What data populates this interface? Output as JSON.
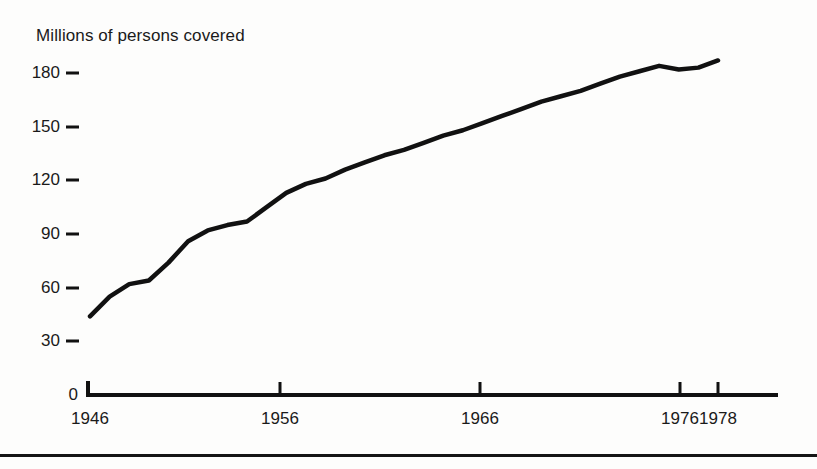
{
  "figure": {
    "width": 817,
    "height": 469,
    "background_color": "#fdfdfc",
    "ink_color": "#111111",
    "bottom_rule": "horizontal-rule"
  },
  "axis_geometry": {
    "x_left_px": 88,
    "x_right_px": 778,
    "y_zero_px": 395,
    "y_180_px": 73,
    "x_1946_px": 90,
    "x_1956_px": 280,
    "x_1966_px": 480,
    "x_1976_px": 680,
    "x_1978_px": 718,
    "line_width_px": 4.5
  },
  "chart_data": {
    "type": "line",
    "title": "Millions of persons covered",
    "xlabel": "",
    "ylabel": "Millions of persons covered",
    "xlim": [
      1946,
      1979.5
    ],
    "ylim": [
      0,
      191
    ],
    "grid": false,
    "legend": false,
    "ytick_labels": [
      "0",
      "30",
      "60",
      "90",
      "120",
      "150",
      "180"
    ],
    "ytick_values": [
      0,
      30,
      60,
      90,
      120,
      150,
      180
    ],
    "xtick_labels": [
      "1946",
      "1956",
      "1966",
      "1976",
      "1978"
    ],
    "xtick_values": [
      1946,
      1956,
      1966,
      1976,
      1978
    ],
    "series": [
      {
        "name": "Persons covered",
        "x": [
          1946,
          1947,
          1948,
          1949,
          1950,
          1951,
          1952,
          1953,
          1954,
          1955,
          1956,
          1957,
          1958,
          1959,
          1960,
          1961,
          1962,
          1963,
          1964,
          1965,
          1966,
          1967,
          1968,
          1969,
          1970,
          1971,
          1972,
          1973,
          1974,
          1975,
          1976,
          1977,
          1978
        ],
        "values": [
          44,
          55,
          62,
          64,
          74,
          86,
          92,
          95,
          97,
          105,
          113,
          118,
          121,
          126,
          130,
          134,
          137,
          141,
          145,
          148,
          152,
          156,
          160,
          164,
          167,
          170,
          174,
          178,
          181,
          184,
          182,
          183,
          187
        ]
      }
    ]
  }
}
